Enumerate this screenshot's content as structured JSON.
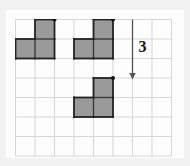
{
  "figure": {
    "type": "geometry-translation-diagram",
    "background_color": "#f2f2f2",
    "canvas_color": "#fdfdfd",
    "grid": {
      "columns": 8,
      "rows": 7,
      "cell_size": 19.5,
      "origin_x": 15,
      "origin_y": 19,
      "line_color": "#d8d8d8",
      "line_width": 1.1,
      "visible": true
    },
    "shape_style": {
      "fill_color": "#9a9a9a",
      "stroke_color": "#222222",
      "stroke_width": 1.8,
      "inner_line_color": "#3a3a3a",
      "inner_line_width": 1.4,
      "vertex_dot_color": "#111111",
      "vertex_dot_radius": 2.0
    },
    "shapes": [
      {
        "name": "original-left-shape",
        "label": "L-tromino",
        "cells": [
          [
            2,
            1
          ],
          [
            1,
            2
          ],
          [
            2,
            2
          ]
        ],
        "vertex_marker_cell_corner": [
          3,
          1
        ]
      },
      {
        "name": "pre-image-shape",
        "label": "L-tromino",
        "cells": [
          [
            5,
            1
          ],
          [
            4,
            2
          ],
          [
            5,
            2
          ]
        ],
        "vertex_marker_cell_corner": [
          6,
          1
        ]
      },
      {
        "name": "image-shape",
        "label": "L-tromino translated",
        "cells": [
          [
            5,
            4
          ],
          [
            4,
            5
          ],
          [
            5,
            5
          ]
        ],
        "vertex_marker_cell_corner": [
          6,
          4
        ]
      }
    ],
    "translation_arrow": {
      "name": "translation-arrow",
      "direction": "down",
      "label": "3",
      "label_color": "#111111",
      "shaft_color": "#555555",
      "start_cell_point": [
        7,
        1
      ],
      "end_cell_point": [
        7,
        4
      ],
      "magnitude_units": 3
    }
  }
}
